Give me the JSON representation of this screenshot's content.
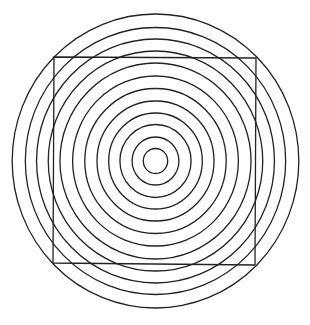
{
  "figure": {
    "title": "Concentric circles with overlaid square (illusion figure)",
    "background": "#ffffff",
    "stroke_color": "#222222",
    "stroke_width": 1.3
  },
  "circles": {
    "center": [
      155.5,
      161
    ],
    "x_scale": 0.975,
    "radii": [
      12.5,
      24,
      36.5,
      48,
      60,
      72.5,
      85,
      98,
      110,
      122,
      133.5,
      147
    ]
  },
  "square": {
    "points": [
      [
        54,
        57
      ],
      [
        256,
        58
      ],
      [
        255,
        265
      ],
      [
        53,
        263
      ]
    ]
  }
}
